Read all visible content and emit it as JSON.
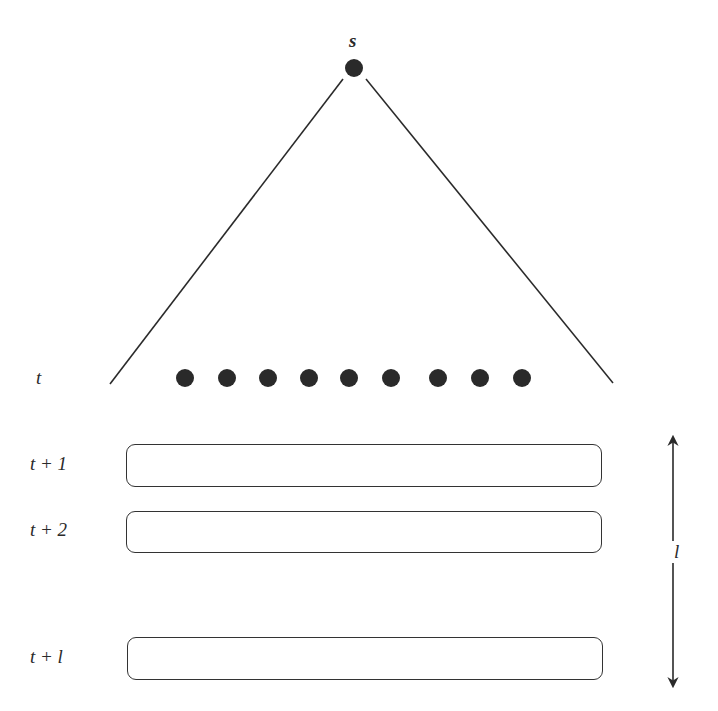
{
  "diagram": {
    "type": "search-tree-lookahead",
    "colors": {
      "ink": "#2a2a2a",
      "background": "#ffffff"
    },
    "root": {
      "label": "s",
      "x": 354,
      "y": 68,
      "r": 9
    },
    "tree_edges": {
      "left": {
        "x1": 343,
        "y1": 79,
        "x2": 110,
        "y2": 384
      },
      "right": {
        "x1": 366,
        "y1": 79,
        "x2": 613,
        "y2": 383
      }
    },
    "frontier": {
      "level_label": "t",
      "y": 378,
      "r": 9,
      "nodes_x": [
        185,
        227,
        268,
        309,
        349,
        391,
        438,
        480,
        522
      ]
    },
    "stages": [
      {
        "label": "t + 1",
        "x": 126,
        "y": 444,
        "w": 476,
        "h": 43
      },
      {
        "label": "t + 2",
        "x": 126,
        "y": 511,
        "w": 476,
        "h": 42
      },
      {
        "label": "t + l",
        "x": 127,
        "y": 637,
        "w": 476,
        "h": 43
      }
    ],
    "span_arrow": {
      "label": "l",
      "x": 673,
      "y_top": 437,
      "y_bottom": 686,
      "gap_top": 541,
      "gap_bottom": 563
    }
  }
}
